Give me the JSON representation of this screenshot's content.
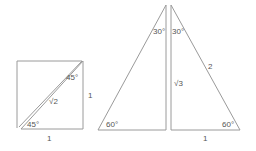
{
  "diagram": {
    "square_triangle": {
      "angle_top": "45°",
      "angle_bottom": "45°",
      "hypotenuse": "√2",
      "right_side": "1",
      "bottom_side": "1"
    },
    "left_30_60_triangle": {
      "angle_top": "30°",
      "angle_bottom": "60°"
    },
    "right_30_60_triangle": {
      "angle_top": "30°",
      "angle_bottom": "60°",
      "vertical_side": "√3",
      "hypotenuse": "2",
      "bottom_side": "1"
    },
    "colors": {
      "line": "#9a9a9a",
      "text": "#555555",
      "background": "#ffffff"
    }
  }
}
